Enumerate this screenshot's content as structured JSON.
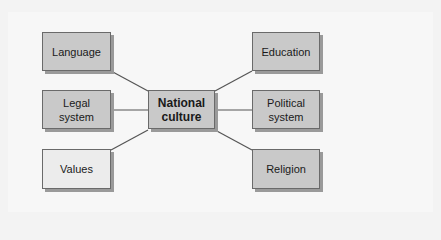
{
  "diagram": {
    "center": {
      "label_line1": "National",
      "label_line2": "culture"
    },
    "left_nodes": [
      {
        "label_line1": "Language",
        "label_line2": ""
      },
      {
        "label_line1": "Legal",
        "label_line2": "system"
      },
      {
        "label_line1": "Values",
        "label_line2": ""
      }
    ],
    "right_nodes": [
      {
        "label_line1": "Education",
        "label_line2": ""
      },
      {
        "label_line1": "Political",
        "label_line2": "system"
      },
      {
        "label_line1": "Religion",
        "label_line2": ""
      }
    ],
    "colors": {
      "box_fill": "#c9c9c9",
      "values_fill": "#ececec",
      "line": "#555555",
      "shadow": "#9a9a9a"
    }
  }
}
